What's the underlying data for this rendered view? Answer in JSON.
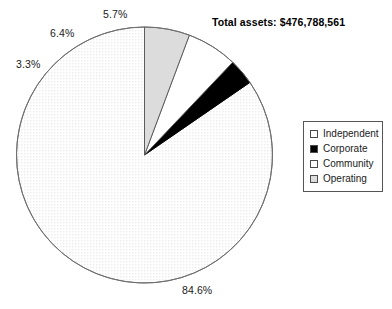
{
  "chart_data": {
    "type": "pie",
    "title": "Total assets: $476,788,561",
    "categories": [
      "Independent",
      "Corporate",
      "Community",
      "Operating"
    ],
    "values": [
      84.6,
      3.3,
      6.4,
      5.7
    ],
    "value_labels": [
      "84.6%",
      "3.3%",
      "6.4%",
      "5.7%"
    ],
    "units": "percent",
    "legend_position": "right",
    "grid": false,
    "xlabel": "",
    "ylabel": "",
    "start_angle_deg": 90,
    "direction": "counterclockwise",
    "slice_colors": [
      "#fcfcfc",
      "#000000",
      "#ffffff",
      "#dcdcdc"
    ],
    "slice_fills": [
      "dotted-light",
      "solid-black",
      "solid-white",
      "solid-lightgray"
    ],
    "outline_color": "#555555"
  },
  "title": {
    "text": "Total assets: $476,788,561"
  },
  "labels": {
    "independent": "84.6%",
    "corporate": "3.3%",
    "community": "6.4%",
    "operating": "5.7%"
  },
  "legend": {
    "items": [
      {
        "label": "Independent",
        "swatch": "#ffffff"
      },
      {
        "label": "Corporate",
        "swatch": "#000000"
      },
      {
        "label": "Community",
        "swatch": "#ffffff"
      },
      {
        "label": "Operating",
        "swatch": "#dcdcdc"
      }
    ]
  }
}
